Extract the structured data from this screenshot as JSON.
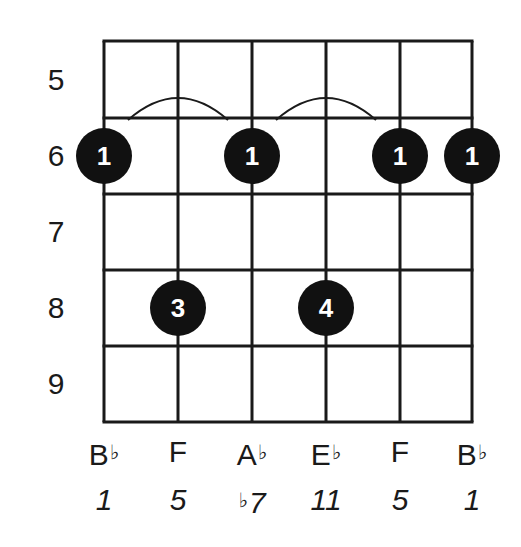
{
  "diagram": {
    "type": "guitar-chord-diagram",
    "orientation": "vertical",
    "strings": 6,
    "frets_shown": [
      5,
      6,
      7,
      8,
      9
    ],
    "fret_labels": [
      "5",
      "6",
      "7",
      "8",
      "9"
    ],
    "colors": {
      "grid": "#1a1a1a",
      "dot_fill": "#111111",
      "dot_text": "#ffffff",
      "background": "#ffffff"
    },
    "dots": [
      {
        "string": 1,
        "fret": 6,
        "finger": "1"
      },
      {
        "string": 3,
        "fret": 6,
        "finger": "1"
      },
      {
        "string": 5,
        "fret": 6,
        "finger": "1"
      },
      {
        "string": 6,
        "fret": 6,
        "finger": "1"
      },
      {
        "string": 2,
        "fret": 8,
        "finger": "3"
      },
      {
        "string": 4,
        "fret": 8,
        "finger": "4"
      }
    ],
    "barre_arcs": [
      {
        "from_string": 1,
        "to_string": 3,
        "fret": 6
      },
      {
        "from_string": 3,
        "to_string": 5,
        "fret": 6
      }
    ],
    "note_names": [
      {
        "letter": "B",
        "accidental": "♭"
      },
      {
        "letter": "F",
        "accidental": ""
      },
      {
        "letter": "A",
        "accidental": "♭"
      },
      {
        "letter": "E",
        "accidental": "♭"
      },
      {
        "letter": "F",
        "accidental": ""
      },
      {
        "letter": "B",
        "accidental": "♭"
      }
    ],
    "intervals": [
      {
        "accidental": "",
        "value": "1"
      },
      {
        "accidental": "",
        "value": "5"
      },
      {
        "accidental": "♭",
        "value": "7"
      },
      {
        "accidental": "",
        "value": "11"
      },
      {
        "accidental": "",
        "value": "5"
      },
      {
        "accidental": "",
        "value": "1"
      }
    ]
  }
}
